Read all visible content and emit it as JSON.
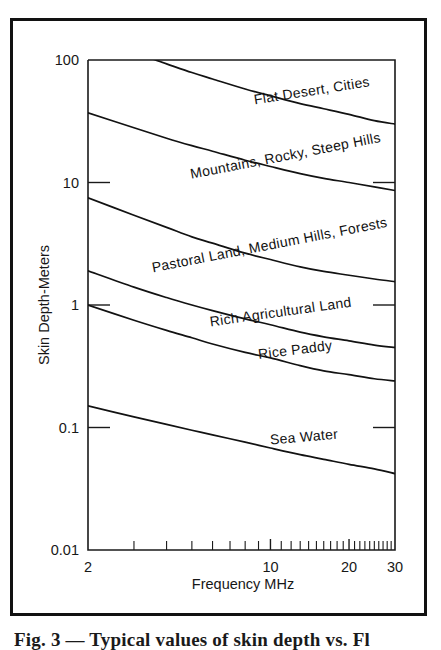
{
  "figure": {
    "caption": "Fig. 3 — Typical values of skin depth vs. Fl"
  },
  "chart_data": {
    "type": "line",
    "title": "",
    "xlabel": "Frequency MHz",
    "ylabel": "Skin Depth-Meters",
    "xscale": "log",
    "yscale": "log",
    "xlim": [
      2,
      30
    ],
    "ylim": [
      0.01,
      100
    ],
    "grid": false,
    "legend": "inline-curve-labels",
    "x_ticks_major": [
      2,
      10,
      20,
      30
    ],
    "x_tick_labels": [
      "2",
      "10",
      "20",
      "30"
    ],
    "x_ticks_minor": [
      3,
      4,
      5,
      6,
      7,
      8,
      9,
      11,
      12,
      13,
      14,
      15,
      16,
      17,
      18,
      19,
      21,
      22,
      23,
      24,
      25,
      26,
      27,
      28,
      29
    ],
    "y_ticks_major": [
      0.01,
      0.1,
      1,
      10,
      100
    ],
    "y_tick_labels": [
      "0.01",
      "0.1",
      "1",
      "10",
      "100"
    ],
    "x": [
      2,
      3,
      4,
      5,
      6,
      8,
      10,
      13,
      16,
      20,
      25,
      30
    ],
    "series": [
      {
        "name": "Flat Desert, Cities",
        "label": "Flat Desert, Cities",
        "values": [
          150,
          115,
          93,
          79,
          70,
          58,
          51,
          44,
          40,
          36,
          32,
          30
        ]
      },
      {
        "name": "Mountains, Rocky, Steep Hills",
        "label": "Mountains, Rocky, Steep Hills",
        "values": [
          37,
          28,
          23,
          20,
          18,
          15.2,
          13.5,
          11.8,
          10.8,
          10.0,
          9.2,
          8.6
        ]
      },
      {
        "name": "Pastoral Land, Medium Hills, Forests",
        "label": "Pastoral Land, Medium Hills, Forests",
        "values": [
          7.5,
          5.4,
          4.3,
          3.6,
          3.2,
          2.65,
          2.35,
          2.05,
          1.88,
          1.75,
          1.63,
          1.55
        ]
      },
      {
        "name": "Rich Agricultural Land",
        "label": "Rich Agricultural Land",
        "values": [
          1.9,
          1.4,
          1.15,
          1.0,
          0.9,
          0.77,
          0.69,
          0.6,
          0.55,
          0.51,
          0.47,
          0.45
        ]
      },
      {
        "name": "Rice Paddy",
        "label": "Rice Paddy",
        "values": [
          1.0,
          0.75,
          0.62,
          0.54,
          0.48,
          0.41,
          0.37,
          0.32,
          0.29,
          0.27,
          0.25,
          0.24
        ]
      },
      {
        "name": "Sea Water",
        "label": "Sea Water",
        "values": [
          0.15,
          0.122,
          0.106,
          0.095,
          0.087,
          0.076,
          0.068,
          0.06,
          0.055,
          0.05,
          0.046,
          0.042
        ]
      }
    ]
  },
  "colors": {
    "ink": "#121212",
    "frame": "#121212",
    "background": "#ffffff"
  }
}
